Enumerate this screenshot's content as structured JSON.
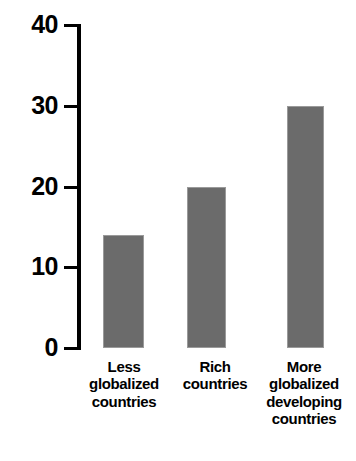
{
  "chart_data": {
    "type": "bar",
    "title": "",
    "title_note": "title row is cropped off the top edge of the screenshot and is not legible",
    "xlabel": "",
    "ylabel": "",
    "categories": [
      "Less globalized countries",
      "Rich countries",
      "More globalized developing countries"
    ],
    "category_lines": [
      [
        "Less",
        "globalized",
        "countries"
      ],
      [
        "Rich",
        "countries"
      ],
      [
        "More",
        "globalized",
        "developing",
        "countries"
      ]
    ],
    "values": [
      14,
      20,
      30
    ],
    "ylim": [
      0,
      40
    ],
    "yticks": [
      0,
      10,
      20,
      30,
      40
    ],
    "ytick_labels": [
      "0",
      "10",
      "20",
      "30",
      "40"
    ],
    "grid": false,
    "legend": false,
    "legend_position": "none",
    "bar_color": "#6b6b6b",
    "bar_edge_color": "#9a9a9a",
    "axis_color": "#000000",
    "text_color": "#000000",
    "background_color": "#ffffff"
  },
  "axis": {
    "ticks": [
      {
        "label": "40",
        "value": 40
      },
      {
        "label": "30",
        "value": 30
      },
      {
        "label": "20",
        "value": 20
      },
      {
        "label": "10",
        "value": 10
      },
      {
        "label": "0",
        "value": 0
      }
    ]
  },
  "bars": [
    {
      "name": "bar-less-globalized",
      "value": 14,
      "lines": [
        "Less",
        "globalized",
        "countries"
      ]
    },
    {
      "name": "bar-rich-countries",
      "value": 20,
      "lines": [
        "Rich",
        "countries"
      ]
    },
    {
      "name": "bar-more-globalized",
      "value": 30,
      "lines": [
        "More",
        "globalized",
        "developing",
        "countries"
      ]
    }
  ]
}
